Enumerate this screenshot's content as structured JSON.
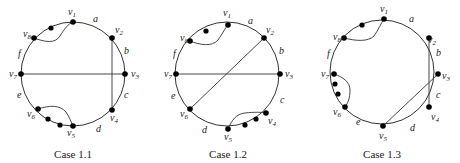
{
  "diagrams": [
    {
      "caption": "Case 1.1",
      "center": [
        73,
        74
      ],
      "radius": 52,
      "vertices": [
        {
          "name": "v1",
          "sub": "1",
          "x": 73,
          "y": 22,
          "lx": 68,
          "ly": 15
        },
        {
          "name": "v2",
          "sub": "2",
          "x": 112,
          "y": 38,
          "lx": 115,
          "ly": 33
        },
        {
          "name": "v3",
          "sub": "3",
          "x": 125,
          "y": 74,
          "lx": 131,
          "ly": 77
        },
        {
          "name": "v4",
          "sub": "4",
          "x": 112,
          "y": 110,
          "lx": 110,
          "ly": 121
        },
        {
          "name": "v5",
          "sub": "5",
          "x": 73,
          "y": 126,
          "lx": 67,
          "ly": 136
        },
        {
          "name": "v6",
          "sub": "6",
          "x": 38,
          "y": 109,
          "lx": 27,
          "ly": 117
        },
        {
          "name": "v7",
          "sub": "7",
          "x": 21,
          "y": 74,
          "lx": 9,
          "ly": 77
        },
        {
          "name": "v8",
          "sub": "8",
          "x": 34,
          "y": 38,
          "lx": 23,
          "ly": 37
        }
      ],
      "extra_dots": [
        [
          51,
          28
        ],
        [
          48,
          119
        ],
        [
          60,
          125
        ]
      ],
      "arc_labels": [
        {
          "text": "a",
          "x": 93,
          "y": 22
        },
        {
          "text": "b",
          "x": 124,
          "y": 54
        },
        {
          "text": "c",
          "x": 124,
          "y": 98
        },
        {
          "text": "d",
          "x": 96,
          "y": 132
        },
        {
          "text": "e",
          "x": 17,
          "y": 98
        },
        {
          "text": "f",
          "x": 18,
          "y": 57
        }
      ],
      "chords": [
        [
          "v7",
          "v3"
        ],
        [
          "v2",
          "v4"
        ]
      ],
      "curves": [
        {
          "from": "v8",
          "to": "v1",
          "path": "M34,38 C45,42 55,44 60,36 C65,28 68,24 73,22"
        },
        {
          "from": "v6",
          "to": "v5",
          "path": "M38,109 C50,105 60,105 66,112 C70,118 71,122 73,126"
        }
      ]
    },
    {
      "caption": "Case 1.2",
      "center": [
        227,
        74
      ],
      "radius": 52,
      "vertices": [
        {
          "name": "v1",
          "sub": "1",
          "x": 228,
          "y": 25,
          "lx": 223,
          "ly": 16
        },
        {
          "name": "v2",
          "sub": "2",
          "x": 264,
          "y": 38,
          "lx": 266,
          "ly": 33
        },
        {
          "name": "v3",
          "sub": "3",
          "x": 280,
          "y": 74,
          "lx": 285,
          "ly": 77
        },
        {
          "name": "v4",
          "sub": "4",
          "x": 266,
          "y": 113,
          "lx": 268,
          "ly": 124
        },
        {
          "name": "v5",
          "sub": "5",
          "x": 228,
          "y": 129,
          "lx": 224,
          "ly": 140
        },
        {
          "name": "v6",
          "sub": "6",
          "x": 190,
          "y": 109,
          "lx": 180,
          "ly": 117
        },
        {
          "name": "v7",
          "sub": "7",
          "x": 176,
          "y": 74,
          "lx": 164,
          "ly": 77
        },
        {
          "name": "v8",
          "sub": "8",
          "x": 190,
          "y": 41,
          "lx": 180,
          "ly": 41
        }
      ],
      "extra_dots": [
        [
          206,
          31
        ],
        [
          245,
          125
        ],
        [
          256,
          119
        ]
      ],
      "arc_labels": [
        {
          "text": "a",
          "x": 248,
          "y": 24
        },
        {
          "text": "b",
          "x": 279,
          "y": 54
        },
        {
          "text": "c",
          "x": 280,
          "y": 103
        },
        {
          "text": "d",
          "x": 202,
          "y": 133
        },
        {
          "text": "e",
          "x": 171,
          "y": 99
        },
        {
          "text": "f",
          "x": 173,
          "y": 57
        }
      ],
      "chords": [
        [
          "v7",
          "v3"
        ],
        [
          "v2",
          "v6"
        ]
      ],
      "curves": [
        {
          "from": "v8",
          "to": "v1",
          "path": "M190,41 C200,45 212,47 218,40 C223,33 225,28 228,25"
        },
        {
          "from": "v5",
          "to": "v4",
          "path": "M228,129 C232,120 236,114 245,113 C254,112 262,112 266,113"
        }
      ]
    },
    {
      "caption": "Case 1.3",
      "center": [
        382,
        72
      ],
      "radius": 52,
      "vertices": [
        {
          "name": "v1",
          "sub": "1",
          "x": 384,
          "y": 19,
          "lx": 380,
          "ly": 12
        },
        {
          "name": "v2",
          "sub": "2",
          "x": 429,
          "y": 38,
          "lx": 428,
          "ly": 43
        },
        {
          "name": "v3",
          "sub": "3",
          "x": 438,
          "y": 74,
          "lx": 442,
          "ly": 79
        },
        {
          "name": "v4",
          "sub": "4",
          "x": 429,
          "y": 107,
          "lx": 431,
          "ly": 120
        },
        {
          "name": "v5",
          "sub": "5",
          "x": 383,
          "y": 126,
          "lx": 379,
          "ly": 139
        },
        {
          "name": "v6",
          "sub": "6",
          "x": 345,
          "y": 107,
          "lx": 333,
          "ly": 115
        },
        {
          "name": "v7",
          "sub": "7",
          "x": 334,
          "y": 74,
          "lx": 321,
          "ly": 77
        },
        {
          "name": "v8",
          "sub": "8",
          "x": 344,
          "y": 38,
          "lx": 333,
          "ly": 40
        }
      ],
      "extra_dots": [
        [
          362,
          25
        ],
        [
          335,
          84
        ],
        [
          338,
          94
        ]
      ],
      "arc_labels": [
        {
          "text": "a",
          "x": 409,
          "y": 22
        },
        {
          "text": "b",
          "x": 436,
          "y": 56
        },
        {
          "text": "c",
          "x": 436,
          "y": 98
        },
        {
          "text": "d",
          "x": 410,
          "y": 131
        },
        {
          "text": "e",
          "x": 356,
          "y": 125
        },
        {
          "text": "f",
          "x": 327,
          "y": 57
        }
      ],
      "chords": [
        [
          "v2",
          "v4"
        ],
        [
          "v3",
          "v5"
        ]
      ],
      "curves": [
        {
          "from": "v8",
          "to": "v1",
          "path": "M344,38 C356,41 368,42 374,36 C379,29 381,23 384,19"
        },
        {
          "from": "v7",
          "to": "v6",
          "path": "M334,74 C343,77 350,82 350,90 C350,98 348,103 345,107"
        }
      ]
    }
  ],
  "captions": {
    "case_1_1": "Case 1.1",
    "case_1_2": "Case 1.2",
    "case_1_3": "Case 1.3"
  }
}
